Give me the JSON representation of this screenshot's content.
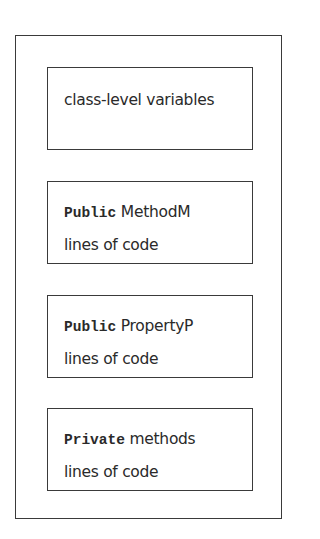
{
  "diagram": {
    "type": "class-structure",
    "outer_label": "",
    "blocks": [
      {
        "keyword": "",
        "text": "class-level variables",
        "second_line": ""
      },
      {
        "keyword": "Public",
        "text": " MethodM",
        "second_line": "lines of code"
      },
      {
        "keyword": "Public",
        "text": " PropertyP",
        "second_line": "lines of code"
      },
      {
        "keyword": "Private",
        "text": " methods",
        "second_line": "lines of code"
      }
    ],
    "colors": {
      "border": "#3a3a3a",
      "text": "#2a2a2a",
      "background": "#ffffff"
    }
  }
}
